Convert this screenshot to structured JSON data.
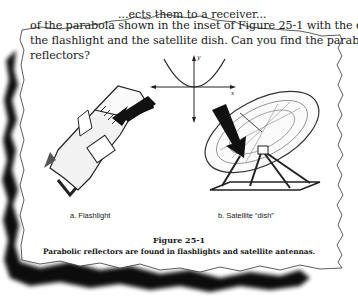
{
  "page": {
    "torn_top_fragment": "...ects them to a receiver...",
    "paragraph_lines": [
      "of the parabola shown in the inset of Figure 25-1 with the d",
      "the flashlight and the satellite dish.  Can you find the parabolic",
      "reflectors?"
    ]
  },
  "figure": {
    "inset": {
      "x_axis_label": "x",
      "y_axis_label": "y",
      "curve": "parabola"
    },
    "panels": [
      {
        "label": "a. Flashlight",
        "battery_text_1": "D",
        "battery_text_2": "CELL",
        "battery_text_3": "BATTER"
      },
      {
        "label": "b. Satellite “dish”"
      }
    ],
    "title": "Figure 25-1",
    "caption": "Parabolic reflectors are found in flashlights and satellite antennas."
  },
  "colors": {
    "paper": "#ffffff",
    "ink": "#1a1a1a",
    "shadow": "#000000"
  }
}
